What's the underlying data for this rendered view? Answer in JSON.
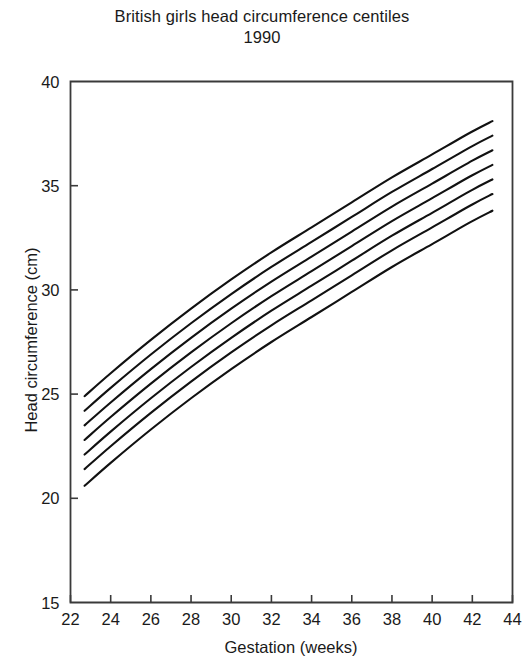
{
  "title": {
    "line1": "British girls head circumference centiles",
    "line2": "1990"
  },
  "axes": {
    "xlabel": "Gestation (weeks)",
    "ylabel": "Head circumference (cm)",
    "x_ticks": [
      "22",
      "24",
      "26",
      "28",
      "30",
      "32",
      "34",
      "36",
      "38",
      "40",
      "42",
      "44"
    ],
    "y_ticks": [
      "15",
      "20",
      "25",
      "30",
      "35",
      "40"
    ]
  },
  "chart_data": {
    "type": "line",
    "title": "British girls head circumference centiles 1990",
    "xlabel": "Gestation (weeks)",
    "ylabel": "Head circumference (cm)",
    "xlim": [
      22,
      44
    ],
    "ylim": [
      15,
      40
    ],
    "xticks": [
      22,
      24,
      26,
      28,
      30,
      32,
      34,
      36,
      38,
      40,
      42,
      44
    ],
    "yticks": [
      15,
      20,
      25,
      30,
      35,
      40
    ],
    "grid": false,
    "legend": "none",
    "x": [
      22.7,
      24,
      26,
      28,
      30,
      32,
      34,
      36,
      38,
      40,
      42,
      43
    ],
    "series": [
      {
        "name": "centile-1",
        "values": [
          23.5,
          24.6,
          26.2,
          27.7,
          29.1,
          30.4,
          31.6,
          32.8,
          34.0,
          35.1,
          36.2,
          36.7
        ]
      },
      {
        "name": "centile-2",
        "values": [
          22.8,
          23.9,
          25.5,
          27.0,
          28.4,
          29.7,
          30.9,
          32.1,
          33.3,
          34.4,
          35.5,
          36.0
        ]
      },
      {
        "name": "centile-3",
        "values": [
          22.1,
          23.2,
          24.8,
          26.3,
          27.7,
          29.0,
          30.2,
          31.4,
          32.6,
          33.7,
          34.8,
          35.3
        ]
      },
      {
        "name": "centile-4",
        "values": [
          21.4,
          22.5,
          24.1,
          25.6,
          27.0,
          28.3,
          29.5,
          30.7,
          31.9,
          33.0,
          34.1,
          34.6
        ]
      },
      {
        "name": "centile-5",
        "values": [
          20.6,
          21.7,
          23.3,
          24.8,
          26.2,
          27.5,
          28.7,
          29.9,
          31.1,
          32.2,
          33.3,
          33.8
        ]
      },
      {
        "name": "centile-6",
        "values": [
          24.2,
          25.3,
          26.9,
          28.4,
          29.8,
          31.1,
          32.3,
          33.5,
          34.7,
          35.8,
          36.9,
          37.4
        ]
      },
      {
        "name": "centile-7",
        "values": [
          24.9,
          26.0,
          27.6,
          29.1,
          30.5,
          31.8,
          33.0,
          34.2,
          35.4,
          36.5,
          37.6,
          38.1
        ]
      }
    ]
  },
  "colors": {
    "curve": "#111111",
    "axis": "#3a3a3a",
    "text": "#1a1a1a",
    "background": "#ffffff"
  }
}
